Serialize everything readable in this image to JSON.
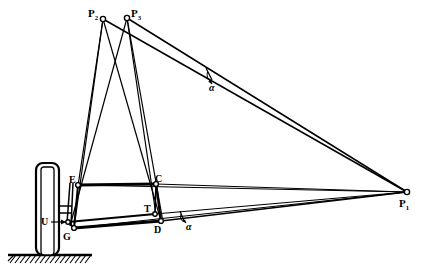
{
  "figure": {
    "type": "technical-line-diagram",
    "background_color": "#ffffff",
    "line_color": "#000000"
  },
  "labels": {
    "p1": {
      "text": "P",
      "sub": "1",
      "x": 399,
      "y": 198
    },
    "p2": {
      "text": "P",
      "sub": "2",
      "x": 88,
      "y": 8
    },
    "p3": {
      "text": "P",
      "sub": "3",
      "x": 131,
      "y": 8
    },
    "e": {
      "text": "E",
      "x": 69,
      "y": 175
    },
    "c": {
      "text": "C",
      "x": 155,
      "y": 174
    },
    "t": {
      "text": "T",
      "x": 144,
      "y": 207
    },
    "d": {
      "text": "D",
      "x": 154,
      "y": 229
    },
    "g": {
      "text": "G",
      "x": 63,
      "y": 233
    },
    "u": {
      "text": "U",
      "x": 43,
      "y": 218
    },
    "alpha_upper": {
      "text": "α",
      "x": 208,
      "y": 83
    },
    "alpha_lower": {
      "text": "α",
      "x": 193,
      "y": 222
    }
  },
  "points": {
    "P1": [
      407,
      192
    ],
    "P2": [
      103,
      19
    ],
    "P3": [
      127,
      18
    ],
    "E": [
      78,
      185
    ],
    "C": [
      156,
      184
    ],
    "T": [
      155,
      214
    ],
    "D": [
      161,
      221
    ],
    "G": [
      74,
      228
    ],
    "U": [
      68,
      222
    ],
    "Kpin_top": [
      70,
      184
    ],
    "Axle_hub": [
      60,
      208
    ],
    "Ground_y": 255,
    "Tire": {
      "x": 36,
      "y": 163,
      "w": 23,
      "h": 92
    }
  },
  "geometry_notes": {
    "ground_line_x0": 8,
    "ground_line_x1": 92,
    "hatch_count": 17,
    "joint_marker_radius": 2.4
  }
}
